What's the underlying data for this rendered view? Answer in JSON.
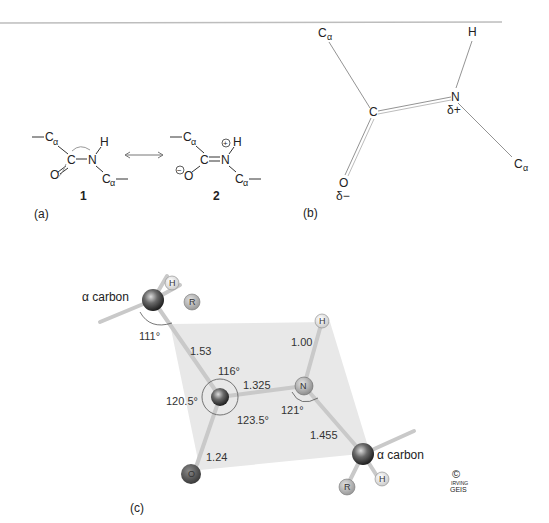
{
  "figure": {
    "top_rule_color": "#bbbbbb",
    "panel_a": {
      "label": "(a)",
      "structure_1": {
        "number": "1",
        "ca_left": "C",
        "ca_sub": "α",
        "carbonyl_c": "C",
        "oxygen": "O",
        "nitrogen": "N",
        "hydrogen": "H",
        "ca_right": "C",
        "ca_right_sub": "α"
      },
      "resonance_arrow": "↔",
      "structure_2": {
        "number": "2",
        "ca_left": "C",
        "ca_sub": "α",
        "carbonyl_c": "C",
        "oxygen": "O",
        "oxygen_charge": "−",
        "nitrogen": "N",
        "nitrogen_charge": "+",
        "hydrogen": "H",
        "ca_right": "C",
        "ca_right_sub": "α"
      }
    },
    "panel_b": {
      "label": "(b)",
      "atoms": {
        "ca_top": "C",
        "ca_top_sub": "α",
        "c": "C",
        "n": "N",
        "n_partial": "δ+",
        "h": "H",
        "o": "O",
        "o_partial": "δ−",
        "ca_bottom": "C",
        "ca_bottom_sub": "α"
      }
    },
    "panel_c": {
      "label": "(c)",
      "plane_color": "#e6e6e6",
      "alpha_carbon_left_label": "α carbon",
      "alpha_carbon_right_label": "α carbon",
      "atom_labels": {
        "h_top_left": "H",
        "r_top_left": "R",
        "h_n": "H",
        "n": "N",
        "o": "O",
        "r_bottom": "R",
        "h_bottom": "H"
      },
      "bond_lengths": {
        "ca_c": "1.53",
        "c_n": "1.325",
        "n_h": "1.00",
        "n_ca": "1.455",
        "c_o": "1.24"
      },
      "angles": {
        "ca_left": "111°",
        "c_top": "116°",
        "c_left": "120.5°",
        "c_bottom": "123.5°",
        "n": "121°"
      },
      "copyright": {
        "symbol": "©",
        "signature_top": "IRVING",
        "signature_bottom": "GEIS"
      }
    }
  }
}
